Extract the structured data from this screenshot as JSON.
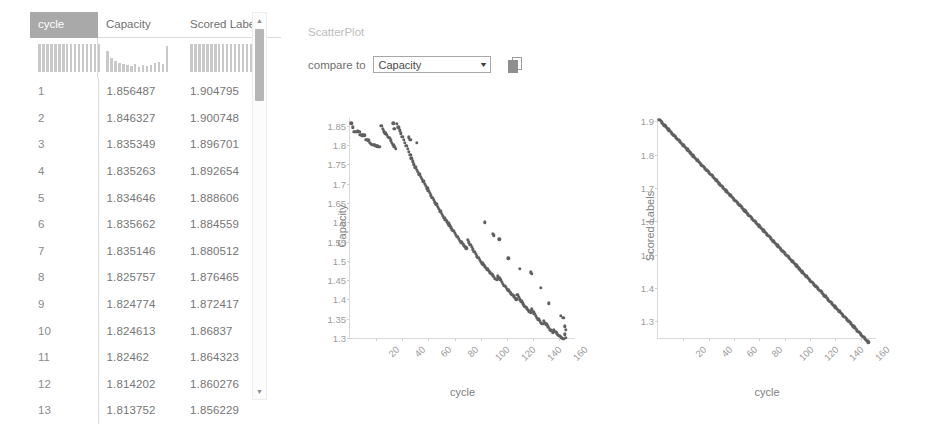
{
  "table": {
    "columns": [
      "cycle",
      "Capacity",
      "Scored Labels"
    ],
    "selected_column": "cycle",
    "rows": [
      {
        "cycle": "1",
        "capacity": "1.856487",
        "scored_labels": "1.904795"
      },
      {
        "cycle": "2",
        "capacity": "1.846327",
        "scored_labels": "1.900748"
      },
      {
        "cycle": "3",
        "capacity": "1.835349",
        "scored_labels": "1.896701"
      },
      {
        "cycle": "4",
        "capacity": "1.835263",
        "scored_labels": "1.892654"
      },
      {
        "cycle": "5",
        "capacity": "1.834646",
        "scored_labels": "1.888606"
      },
      {
        "cycle": "6",
        "capacity": "1.835662",
        "scored_labels": "1.884559"
      },
      {
        "cycle": "7",
        "capacity": "1.835146",
        "scored_labels": "1.880512"
      },
      {
        "cycle": "8",
        "capacity": "1.825757",
        "scored_labels": "1.876465"
      },
      {
        "cycle": "9",
        "capacity": "1.824774",
        "scored_labels": "1.872417"
      },
      {
        "cycle": "10",
        "capacity": "1.824613",
        "scored_labels": "1.86837"
      },
      {
        "cycle": "11",
        "capacity": "1.82462",
        "scored_labels": "1.864323"
      },
      {
        "cycle": "12",
        "capacity": "1.814202",
        "scored_labels": "1.860276"
      },
      {
        "cycle": "13",
        "capacity": "1.813752",
        "scored_labels": "1.856229"
      }
    ],
    "histograms": {
      "cycle": [
        92,
        93,
        92,
        94,
        93,
        92,
        94,
        93,
        92,
        94,
        93,
        92,
        94,
        92,
        93,
        92
      ],
      "capacity": [
        70,
        48,
        36,
        30,
        26,
        22,
        20,
        26,
        18,
        22,
        20,
        24,
        30,
        34,
        26,
        88
      ],
      "scored_labels": [
        92,
        93,
        92,
        94,
        93,
        92,
        94,
        93,
        92,
        94,
        93,
        92,
        94,
        92,
        93,
        92
      ]
    },
    "scrollbar": {
      "up_arrow": "▲",
      "down_arrow": "▼"
    }
  },
  "panel": {
    "title": "ScatterPlot",
    "compare_label": "compare to",
    "dropdown_value": "Capacity",
    "dropdown_options": [
      "cycle",
      "Capacity",
      "Scored Labels"
    ],
    "dropdown_arrow": "▼",
    "copy_icon_name": "copy-icon"
  },
  "chart_data": [
    {
      "type": "scatter",
      "title": "",
      "xlabel": "cycle",
      "ylabel": "Capacity",
      "xlim": [
        0,
        172
      ],
      "ylim": [
        1.3,
        1.87
      ],
      "xticks": [
        20,
        40,
        60,
        80,
        100,
        120,
        140,
        160
      ],
      "yticks": [
        1.3,
        1.35,
        1.4,
        1.45,
        1.5,
        1.55,
        1.6,
        1.65,
        1.7,
        1.75,
        1.8,
        1.85
      ],
      "grid": false,
      "marker_color": "#5f5f5f",
      "points": [
        [
          1,
          1.856
        ],
        [
          2,
          1.846
        ],
        [
          3,
          1.835
        ],
        [
          4,
          1.835
        ],
        [
          5,
          1.835
        ],
        [
          6,
          1.836
        ],
        [
          7,
          1.835
        ],
        [
          8,
          1.826
        ],
        [
          9,
          1.825
        ],
        [
          10,
          1.825
        ],
        [
          11,
          1.825
        ],
        [
          12,
          1.814
        ],
        [
          13,
          1.814
        ],
        [
          14,
          1.812
        ],
        [
          15,
          1.806
        ],
        [
          16,
          1.803
        ],
        [
          17,
          1.801
        ],
        [
          18,
          1.8
        ],
        [
          19,
          1.799
        ],
        [
          20,
          1.798
        ],
        [
          21,
          1.797
        ],
        [
          22,
          1.796
        ],
        [
          23,
          1.795
        ],
        [
          24,
          1.849
        ],
        [
          25,
          1.842
        ],
        [
          26,
          1.836
        ],
        [
          27,
          1.83
        ],
        [
          28,
          1.826
        ],
        [
          29,
          1.822
        ],
        [
          30,
          1.818
        ],
        [
          31,
          1.812
        ],
        [
          32,
          1.806
        ],
        [
          33,
          1.8
        ],
        [
          34,
          1.795
        ],
        [
          35,
          1.79
        ],
        [
          36,
          1.855
        ],
        [
          37,
          1.846
        ],
        [
          38,
          1.838
        ],
        [
          39,
          1.83
        ],
        [
          40,
          1.822
        ],
        [
          41,
          1.814
        ],
        [
          42,
          1.806
        ],
        [
          43,
          1.798
        ],
        [
          44,
          1.79
        ],
        [
          45,
          1.782
        ],
        [
          46,
          1.774
        ],
        [
          47,
          1.766
        ],
        [
          48,
          1.758
        ],
        [
          49,
          1.75
        ],
        [
          50,
          1.742
        ],
        [
          51,
          1.736
        ],
        [
          52,
          1.73
        ],
        [
          53,
          1.724
        ],
        [
          54,
          1.718
        ],
        [
          55,
          1.712
        ],
        [
          56,
          1.706
        ],
        [
          57,
          1.7
        ],
        [
          58,
          1.694
        ],
        [
          59,
          1.688
        ],
        [
          60,
          1.682
        ],
        [
          61,
          1.676
        ],
        [
          62,
          1.67
        ],
        [
          63,
          1.664
        ],
        [
          64,
          1.658
        ],
        [
          65,
          1.652
        ],
        [
          66,
          1.646
        ],
        [
          67,
          1.64
        ],
        [
          68,
          1.634
        ],
        [
          69,
          1.628
        ],
        [
          70,
          1.622
        ],
        [
          71,
          1.617
        ],
        [
          72,
          1.612
        ],
        [
          73,
          1.607
        ],
        [
          74,
          1.602
        ],
        [
          75,
          1.597
        ],
        [
          76,
          1.592
        ],
        [
          77,
          1.587
        ],
        [
          78,
          1.582
        ],
        [
          79,
          1.577
        ],
        [
          80,
          1.572
        ],
        [
          81,
          1.567
        ],
        [
          82,
          1.562
        ],
        [
          83,
          1.557
        ],
        [
          84,
          1.552
        ],
        [
          85,
          1.548
        ],
        [
          86,
          1.544
        ],
        [
          87,
          1.54
        ],
        [
          88,
          1.536
        ],
        [
          89,
          1.532
        ],
        [
          90,
          1.555
        ],
        [
          91,
          1.548
        ],
        [
          92,
          1.542
        ],
        [
          93,
          1.536
        ],
        [
          94,
          1.53
        ],
        [
          95,
          1.524
        ],
        [
          96,
          1.518
        ],
        [
          97,
          1.512
        ],
        [
          98,
          1.507
        ],
        [
          99,
          1.502
        ],
        [
          100,
          1.498
        ],
        [
          101,
          1.494
        ],
        [
          102,
          1.49
        ],
        [
          103,
          1.486
        ],
        [
          104,
          1.482
        ],
        [
          105,
          1.478
        ],
        [
          106,
          1.474
        ],
        [
          107,
          1.47
        ],
        [
          108,
          1.466
        ],
        [
          109,
          1.462
        ],
        [
          110,
          1.458
        ],
        [
          111,
          1.454
        ],
        [
          112,
          1.45
        ],
        [
          113,
          1.46
        ],
        [
          114,
          1.455
        ],
        [
          115,
          1.45
        ],
        [
          116,
          1.445
        ],
        [
          117,
          1.44
        ],
        [
          118,
          1.436
        ],
        [
          119,
          1.432
        ],
        [
          120,
          1.428
        ],
        [
          121,
          1.424
        ],
        [
          122,
          1.42
        ],
        [
          123,
          1.416
        ],
        [
          124,
          1.412
        ],
        [
          125,
          1.408
        ],
        [
          126,
          1.404
        ],
        [
          127,
          1.4
        ],
        [
          128,
          1.412
        ],
        [
          129,
          1.406
        ],
        [
          130,
          1.4
        ],
        [
          131,
          1.395
        ],
        [
          132,
          1.39
        ],
        [
          133,
          1.385
        ],
        [
          134,
          1.381
        ],
        [
          135,
          1.377
        ],
        [
          136,
          1.373
        ],
        [
          137,
          1.369
        ],
        [
          138,
          1.365
        ],
        [
          139,
          1.374
        ],
        [
          140,
          1.368
        ],
        [
          141,
          1.362
        ],
        [
          142,
          1.357
        ],
        [
          143,
          1.352
        ],
        [
          144,
          1.348
        ],
        [
          145,
          1.344
        ],
        [
          146,
          1.34
        ],
        [
          147,
          1.336
        ],
        [
          148,
          1.345
        ],
        [
          149,
          1.34
        ],
        [
          150,
          1.335
        ],
        [
          151,
          1.33
        ],
        [
          152,
          1.326
        ],
        [
          153,
          1.322
        ],
        [
          154,
          1.318
        ],
        [
          155,
          1.314
        ],
        [
          156,
          1.32
        ],
        [
          157,
          1.316
        ],
        [
          158,
          1.312
        ],
        [
          159,
          1.308
        ],
        [
          160,
          1.305
        ],
        [
          161,
          1.302
        ],
        [
          162,
          1.3
        ],
        [
          163,
          1.298
        ],
        [
          164,
          1.31
        ],
        [
          165,
          1.3
        ],
        [
          33,
          1.856
        ],
        [
          34,
          1.842
        ],
        [
          45,
          1.82
        ],
        [
          46,
          1.814
        ],
        [
          51,
          1.806
        ],
        [
          103,
          1.6
        ],
        [
          109,
          1.57
        ],
        [
          110,
          1.566
        ],
        [
          114,
          1.556
        ],
        [
          121,
          1.506
        ],
        [
          130,
          1.48
        ],
        [
          138,
          1.47
        ],
        [
          139,
          1.466
        ],
        [
          146,
          1.43
        ],
        [
          152,
          1.39
        ],
        [
          161,
          1.358
        ],
        [
          163,
          1.352
        ],
        [
          164,
          1.33
        ],
        [
          165,
          1.322
        ]
      ]
    },
    {
      "type": "scatter",
      "title": "",
      "xlabel": "cycle",
      "ylabel": "Scored Labels",
      "xlim": [
        0,
        172
      ],
      "ylim": [
        1.25,
        1.91
      ],
      "xticks": [
        20,
        40,
        60,
        80,
        100,
        120,
        140,
        160
      ],
      "yticks": [
        1.3,
        1.4,
        1.5,
        1.6,
        1.7,
        1.8,
        1.9
      ],
      "grid": false,
      "marker_color": "#5f5f5f",
      "relation": "linear",
      "intercept": 1.908842,
      "slope": -0.0040472,
      "n_points": 166
    }
  ]
}
